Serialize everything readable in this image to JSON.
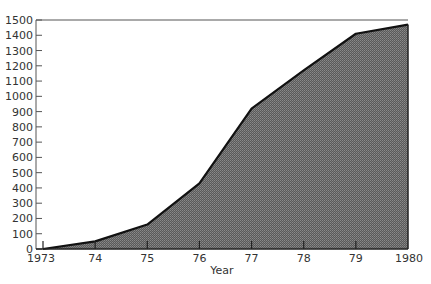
{
  "chart_data": {
    "type": "area",
    "title": "",
    "xlabel": "Year",
    "ylabel": "",
    "categories": [
      "1973",
      "74",
      "75",
      "76",
      "77",
      "78",
      "79",
      "1980"
    ],
    "x": [
      1973,
      1974,
      1975,
      1976,
      1977,
      1978,
      1979,
      1980
    ],
    "values": [
      0,
      50,
      160,
      430,
      920,
      1170,
      1410,
      1470
    ],
    "yticks": [
      0,
      100,
      200,
      300,
      400,
      500,
      600,
      700,
      800,
      900,
      1000,
      1100,
      1200,
      1300,
      1400,
      1500
    ],
    "ylim": [
      0,
      1500
    ],
    "xlim": [
      1973,
      1980
    ],
    "grid": false,
    "legend": null,
    "fill_color": "#6e6e6e",
    "line_color": "#111111"
  }
}
